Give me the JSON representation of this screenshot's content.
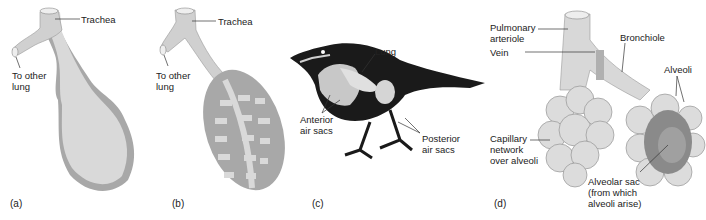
{
  "figure": {
    "panels": [
      {
        "id": "a",
        "label": "(a)",
        "annotations": {
          "trachea": "Trachea",
          "to_other_lung": "To other\nlung"
        }
      },
      {
        "id": "b",
        "label": "(b)",
        "annotations": {
          "trachea": "Trachea",
          "to_other_lung": "To other\nlung"
        }
      },
      {
        "id": "c",
        "label": "(c)",
        "annotations": {
          "lung": "Lung",
          "anterior_air_sacs": "Anterior\nair sacs",
          "posterior_air_sacs": "Posterior\nair sacs"
        }
      },
      {
        "id": "d",
        "label": "(d)",
        "annotations": {
          "pulmonary_arteriole": "Pulmonary\narteriole",
          "vein": "Vein",
          "bronchiole": "Bronchiole",
          "alveoli": "Alveoli",
          "capillary_network": "Capillary\nnetwork\nover alveoli",
          "alveolar_sac": "Alveolar sac\n(from which\nalveoli arise)"
        }
      }
    ],
    "colors": {
      "tissue_light": "#d9d9d9",
      "tissue_mid": "#a8a8a8",
      "tissue_dark": "#8a8a8a",
      "bird_body": "#1a1a1a",
      "leader_line": "#333333"
    }
  }
}
